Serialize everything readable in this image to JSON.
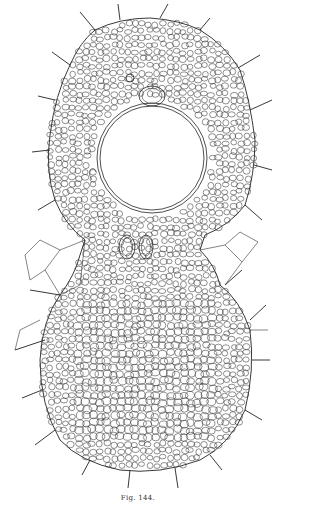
{
  "figure": {
    "caption": "Fig. 144.",
    "ink_color": "#222222",
    "background_color": "#ffffff"
  }
}
